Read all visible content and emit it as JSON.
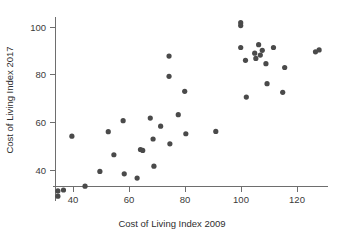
{
  "chart_data": {
    "type": "scatter",
    "title": "",
    "xlabel": "Cost of Living Index 2009",
    "ylabel": "Cost of Living Index 2017",
    "xlim": [
      33,
      131
    ],
    "ylim": [
      27,
      104
    ],
    "xticks": [
      40,
      60,
      80,
      100,
      120
    ],
    "yticks": [
      40,
      60,
      80,
      100
    ],
    "xtick_labels": [
      "40",
      "60",
      "80",
      "100",
      "120"
    ],
    "ytick_labels": [
      "40",
      "60",
      "80",
      "100"
    ],
    "grid": false,
    "legend": null,
    "marker": "filled-circle",
    "marker_color": "#4a4a4a",
    "marker_size": 2.6,
    "points": [
      {
        "x": 34.6,
        "y": 31.2
      },
      {
        "x": 34.6,
        "y": 29.0
      },
      {
        "x": 36.6,
        "y": 31.6
      },
      {
        "x": 39.6,
        "y": 54.2
      },
      {
        "x": 44.3,
        "y": 33.2
      },
      {
        "x": 49.6,
        "y": 39.4
      },
      {
        "x": 52.6,
        "y": 56.1
      },
      {
        "x": 54.6,
        "y": 46.4
      },
      {
        "x": 57.9,
        "y": 60.7
      },
      {
        "x": 58.3,
        "y": 38.4
      },
      {
        "x": 62.9,
        "y": 36.6
      },
      {
        "x": 64.1,
        "y": 48.6
      },
      {
        "x": 64.9,
        "y": 48.2
      },
      {
        "x": 67.6,
        "y": 61.8
      },
      {
        "x": 68.6,
        "y": 53.0
      },
      {
        "x": 68.9,
        "y": 41.6
      },
      {
        "x": 71.3,
        "y": 58.4
      },
      {
        "x": 74.3,
        "y": 87.8
      },
      {
        "x": 74.3,
        "y": 79.3
      },
      {
        "x": 74.6,
        "y": 51.0
      },
      {
        "x": 77.6,
        "y": 63.2
      },
      {
        "x": 79.9,
        "y": 73.0
      },
      {
        "x": 80.3,
        "y": 55.2
      },
      {
        "x": 91.0,
        "y": 56.2
      },
      {
        "x": 99.9,
        "y": 101.8
      },
      {
        "x": 99.9,
        "y": 100.6
      },
      {
        "x": 99.9,
        "y": 91.4
      },
      {
        "x": 101.6,
        "y": 86.0
      },
      {
        "x": 101.9,
        "y": 70.6
      },
      {
        "x": 104.9,
        "y": 89.0
      },
      {
        "x": 105.3,
        "y": 86.8
      },
      {
        "x": 106.3,
        "y": 92.6
      },
      {
        "x": 106.9,
        "y": 88.2
      },
      {
        "x": 107.6,
        "y": 90.2
      },
      {
        "x": 108.9,
        "y": 84.6
      },
      {
        "x": 109.3,
        "y": 76.2
      },
      {
        "x": 111.6,
        "y": 91.4
      },
      {
        "x": 114.9,
        "y": 72.6
      },
      {
        "x": 115.6,
        "y": 83.0
      },
      {
        "x": 126.6,
        "y": 89.6
      },
      {
        "x": 127.9,
        "y": 90.4
      }
    ]
  },
  "axes": {
    "x_axis_label": "Cost of Living Index 2009",
    "y_axis_label": "Cost of Living Index 2017"
  },
  "colors": {
    "background": "#ffffff",
    "axis": "#6e6e6e",
    "text": "#2e2e2e",
    "marker": "#4a4a4a"
  }
}
